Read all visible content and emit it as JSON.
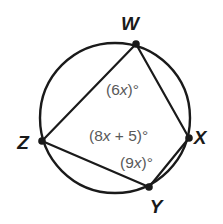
{
  "figure": {
    "type": "circle-inscribed-quadrilateral",
    "colors": {
      "stroke": "#1a1a1a",
      "vertex_dot": "#1a1a1a",
      "angle_text": "#595959",
      "background": "#ffffff"
    },
    "circle": {
      "center_x": 115,
      "center_y": 118,
      "radius": 75,
      "stroke_width": 2.4
    },
    "vertices": [
      {
        "id": "W",
        "label": "W",
        "x": 136,
        "y": 44,
        "label_x": 130,
        "label_y": 30,
        "dot_radius": 3.8
      },
      {
        "id": "X",
        "label": "X",
        "x": 189,
        "y": 138,
        "label_x": 200,
        "label_y": 144,
        "dot_radius": 3.8
      },
      {
        "id": "Y",
        "label": "Y",
        "x": 149,
        "y": 187,
        "label_x": 156,
        "label_y": 213,
        "dot_radius": 3.8
      },
      {
        "id": "Z",
        "label": "Z",
        "x": 42,
        "y": 141,
        "label_x": 23,
        "label_y": 149,
        "dot_radius": 3.8
      }
    ],
    "chords": [
      {
        "id": "WZ",
        "from": "W",
        "to": "Z"
      },
      {
        "id": "WX",
        "from": "W",
        "to": "X"
      },
      {
        "id": "ZY",
        "from": "Z",
        "to": "Y"
      },
      {
        "id": "YX",
        "from": "Y",
        "to": "X"
      }
    ],
    "angle_labels": [
      {
        "id": "angle-W",
        "at_vertex": "W",
        "prefix": "(6",
        "var": "x",
        "suffix": ")°",
        "text": "(6x)°",
        "x": 106,
        "y": 95
      },
      {
        "id": "angle-Z",
        "at_vertex": "Z",
        "prefix": "(8",
        "var": "x",
        "suffix": " + 5)°",
        "text": "(8x + 5)°",
        "x": 89,
        "y": 141
      },
      {
        "id": "angle-Y",
        "at_vertex": "Y",
        "prefix": "(9",
        "var": "x",
        "suffix": ")°",
        "text": "(9x)°",
        "x": 120,
        "y": 168
      }
    ]
  }
}
